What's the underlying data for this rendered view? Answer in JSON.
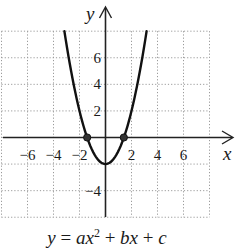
{
  "chart_data": {
    "type": "line",
    "title": "",
    "caption": "y = ax^2 + bx + c",
    "caption_parts": {
      "lhs": "y",
      "eq": " = ",
      "a": "a",
      "x1": "x",
      "exp": "2",
      "plus1": " + ",
      "b": "b",
      "x2": "x",
      "plus2": " + ",
      "c": "c"
    },
    "xlabel": "x",
    "ylabel": "y",
    "xlim": [
      -8,
      8
    ],
    "ylim": [
      -6,
      8
    ],
    "grid": true,
    "grid_step": 2,
    "x_ticks": [
      -6,
      -4,
      -2,
      2,
      4,
      6
    ],
    "x_tick_labels": [
      "−6",
      "−4",
      "−2",
      "2",
      "4",
      "6"
    ],
    "y_ticks": [
      6,
      4,
      2,
      -4
    ],
    "y_tick_labels": [
      "6",
      "4",
      "2",
      "−4"
    ],
    "series": [
      {
        "name": "parabola",
        "equation": "y = x^2 - 2",
        "coefficients": {
          "a": 1,
          "b": 0,
          "c": -2
        },
        "x": [
          -3.16,
          -3,
          -2.5,
          -2,
          -1.5,
          -1,
          -0.5,
          0,
          0.5,
          1,
          1.5,
          2,
          2.5,
          3,
          3.16
        ],
        "y": [
          8,
          7,
          4.25,
          2,
          0.25,
          -1,
          -1.75,
          -2,
          -1.75,
          -1,
          0.25,
          2,
          4.25,
          7,
          8
        ]
      }
    ],
    "points": [
      {
        "label": "x-intercept left",
        "x": -1.41,
        "y": 0
      },
      {
        "label": "x-intercept right",
        "x": 1.41,
        "y": 0
      }
    ],
    "vertex": {
      "x": 0,
      "y": -2
    }
  },
  "colors": {
    "curve": "#111111",
    "grid": "#9a9a9a",
    "axis": "#222222"
  }
}
